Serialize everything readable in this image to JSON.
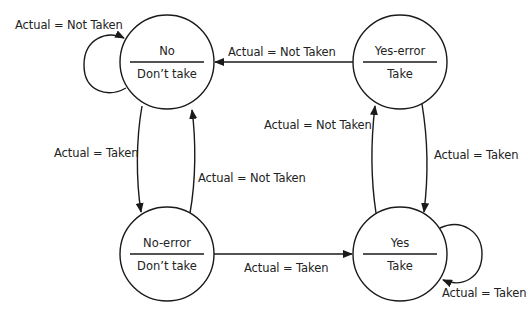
{
  "diagram": {
    "type": "state-machine",
    "title": "",
    "colors": {
      "stroke": "#1a1a1a",
      "text": "#222222",
      "background": "#ffffff"
    },
    "states": [
      {
        "id": "no",
        "name": "No",
        "output": "Don’t take"
      },
      {
        "id": "yes_error",
        "name": "Yes-error",
        "output": "Take"
      },
      {
        "id": "no_error",
        "name": "No-error",
        "output": "Don’t take"
      },
      {
        "id": "yes",
        "name": "Yes",
        "output": "Take"
      }
    ],
    "transitions": [
      {
        "from": "no",
        "to": "no",
        "label": "Actual = Not Taken"
      },
      {
        "from": "yes_error",
        "to": "no",
        "label": "Actual = Not Taken"
      },
      {
        "from": "no",
        "to": "no_error",
        "label": "Actual = Taken"
      },
      {
        "from": "no_error",
        "to": "no",
        "label": "Actual = Not Taken"
      },
      {
        "from": "yes",
        "to": "yes_error",
        "label": "Actual = Not Taken"
      },
      {
        "from": "yes_error",
        "to": "yes",
        "label": "Actual = Taken"
      },
      {
        "from": "no_error",
        "to": "yes",
        "label": "Actual = Taken"
      },
      {
        "from": "yes",
        "to": "yes",
        "label": "Actual = Taken"
      }
    ]
  }
}
